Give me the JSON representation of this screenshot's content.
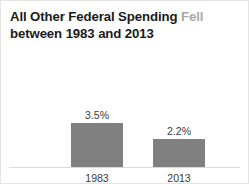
{
  "card": {
    "title_line1_main": "All Other Federal Spending",
    "title_line1_emphasis": "Fell",
    "title_line2": "between 1983 and 2013"
  },
  "chart_data": {
    "type": "bar",
    "title": "All Other Federal Spending Fell between 1983 and 2013",
    "categories": [
      "1983",
      "2013"
    ],
    "values": [
      3.5,
      2.2
    ],
    "value_labels": [
      "3.5%",
      "2.2%"
    ],
    "xlabel": "",
    "ylabel": "",
    "ylim": [
      0,
      4
    ],
    "grid": false,
    "legend": false,
    "bar_color": "#808080",
    "baseline_color": "#d9d9d9",
    "background_color": "#ffffff",
    "border_color": "#e3e3e3",
    "title_color": "#1a1a1a",
    "title_emphasis_color": "#a8a8a8",
    "label_color": "#3a3a3a"
  }
}
